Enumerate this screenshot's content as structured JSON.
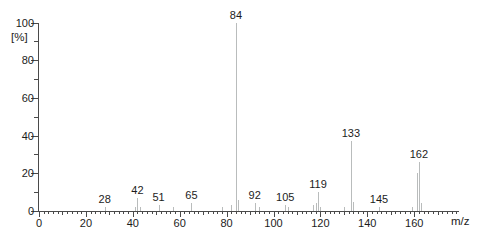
{
  "chart_data": {
    "type": "bar",
    "subtype": "mass-spectrum",
    "title": "",
    "xlabel": "m/z",
    "ylabel": "[%]",
    "xlim": [
      0,
      178
    ],
    "ylim": [
      0,
      100
    ],
    "grid": false,
    "legend": null,
    "x_major_ticks": [
      0,
      20,
      40,
      60,
      80,
      100,
      120,
      140,
      160
    ],
    "x_minor_tick_step": 2,
    "x_medium_tick_step": 10,
    "y_major_ticks": [
      0,
      20,
      40,
      60,
      80,
      100
    ],
    "y_minor_tick_step": 10,
    "peaks": [
      {
        "mz": 28,
        "intensity": 2,
        "label": "28"
      },
      {
        "mz": 41,
        "intensity": 2
      },
      {
        "mz": 42,
        "intensity": 7,
        "label": "42"
      },
      {
        "mz": 43,
        "intensity": 2
      },
      {
        "mz": 51,
        "intensity": 3,
        "label": "51"
      },
      {
        "mz": 57,
        "intensity": 2
      },
      {
        "mz": 65,
        "intensity": 4,
        "label": "65"
      },
      {
        "mz": 78,
        "intensity": 2
      },
      {
        "mz": 82,
        "intensity": 3
      },
      {
        "mz": 84,
        "intensity": 100,
        "label": "84"
      },
      {
        "mz": 85,
        "intensity": 6
      },
      {
        "mz": 92,
        "intensity": 4,
        "label": "92"
      },
      {
        "mz": 94,
        "intensity": 2
      },
      {
        "mz": 105,
        "intensity": 3,
        "label": "105"
      },
      {
        "mz": 106,
        "intensity": 2
      },
      {
        "mz": 117,
        "intensity": 3
      },
      {
        "mz": 118,
        "intensity": 4
      },
      {
        "mz": 119,
        "intensity": 10,
        "label": "119"
      },
      {
        "mz": 120,
        "intensity": 2
      },
      {
        "mz": 130,
        "intensity": 2
      },
      {
        "mz": 133,
        "intensity": 37,
        "label": "133"
      },
      {
        "mz": 134,
        "intensity": 5
      },
      {
        "mz": 145,
        "intensity": 2,
        "label": "145"
      },
      {
        "mz": 159,
        "intensity": 2
      },
      {
        "mz": 161,
        "intensity": 20
      },
      {
        "mz": 162,
        "intensity": 26,
        "label": "162"
      },
      {
        "mz": 163,
        "intensity": 4
      }
    ],
    "colors": {
      "background": "#ffffff",
      "peak": "#b9bcbc",
      "axis": "#4a4a4a",
      "tick": "#4a4a4a",
      "text": "#1c1c1c"
    }
  }
}
